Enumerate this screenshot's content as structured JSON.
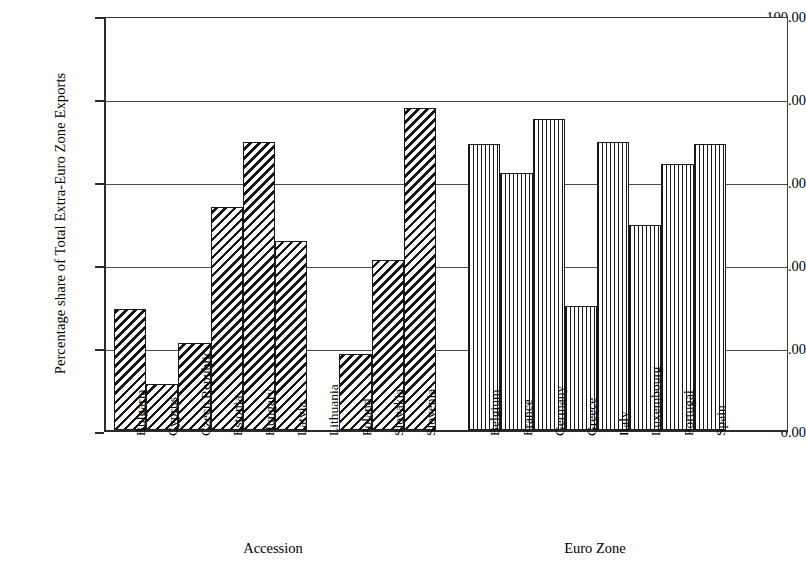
{
  "chart_data": {
    "type": "bar",
    "title": "",
    "subtitle": "",
    "xlabel": "",
    "ylabel": "Percentage share of Total Extra-Euro Zone Exports",
    "ylim": [
      0,
      100
    ],
    "ytick_labels": [
      "100.00",
      "80.00",
      "60.00",
      "40.00",
      "20.00",
      "0.00"
    ],
    "ytick_values": [
      100,
      80,
      60,
      40,
      20,
      0
    ],
    "grid": true,
    "legend": "none",
    "categories": [
      "Bulgaria",
      "Cyprus",
      "Czech Republic",
      "Estonia",
      "Hungary",
      "Latvia",
      "Lithuania",
      "Poland",
      "Slovakia",
      "Slovenia",
      "Belgium",
      "France",
      "Germany",
      "Greece",
      "Italy",
      "Luxembourg",
      "Portugal",
      "Spain"
    ],
    "values": [
      29.2,
      11.0,
      20.9,
      53.8,
      69.5,
      45.6,
      0.0,
      18.4,
      41.0,
      77.5,
      68.8,
      62.0,
      75.0,
      30.0,
      69.4,
      49.5,
      64.0,
      68.8
    ],
    "groups": [
      {
        "name": "Accession",
        "pattern": "diagonal-hatch",
        "categories": [
          "Bulgaria",
          "Cyprus",
          "Czech Republic",
          "Estonia",
          "Hungary",
          "Latvia",
          "Lithuania",
          "Poland",
          "Slovakia",
          "Slovenia"
        ],
        "values": [
          29.2,
          11.0,
          20.9,
          53.8,
          69.5,
          45.6,
          0.0,
          18.4,
          41.0,
          77.5
        ]
      },
      {
        "name": "Euro Zone",
        "pattern": "vertical-line-hatch",
        "categories": [
          "Belgium",
          "France",
          "Germany",
          "Greece",
          "Italy",
          "Luxembourg",
          "Portugal",
          "Spain"
        ],
        "values": [
          68.8,
          62.0,
          75.0,
          30.0,
          69.4,
          49.5,
          64.0,
          68.8
        ]
      }
    ],
    "colors": {
      "axis": "#2b2b2b",
      "grid": "#4a4a4a",
      "bar_outline": "#1a1a1a",
      "hatch": "#141414",
      "background": "#ffffff"
    }
  }
}
